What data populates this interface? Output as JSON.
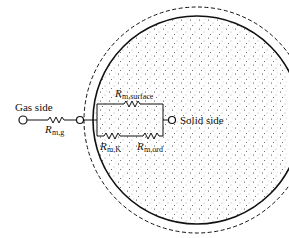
{
  "diagram": {
    "labels": {
      "gas_side": "Gas side",
      "solid_side": "Solid side",
      "r_main": "R",
      "r_gas_sub": "m,g",
      "r_surface_sub": "m,surface",
      "r_knudsen_sub": "m,K",
      "r_ord_sub": "m,ord"
    },
    "colors": {
      "line": "#111111",
      "particle_fill": "#f4f4f4",
      "background": "#ffffff"
    }
  }
}
